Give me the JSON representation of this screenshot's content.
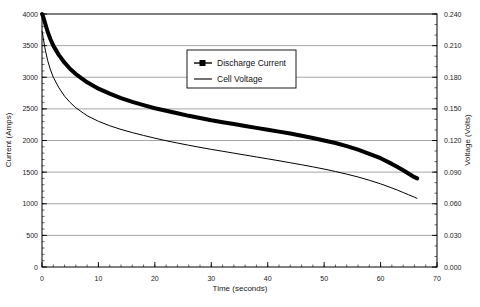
{
  "chart_data": {
    "type": "line",
    "title": "",
    "xlabel": "Time  (seconds)",
    "ylabel": "Current (Amps)",
    "y2label": "Voltage (Volts)",
    "xlim": [
      0,
      70
    ],
    "ylim": [
      0,
      4000
    ],
    "y2lim": [
      0.0,
      0.24
    ],
    "grid": true,
    "legend_position": "top-center",
    "xticks": [
      0,
      10,
      20,
      30,
      40,
      50,
      60,
      70
    ],
    "xtick_labels": [
      "0",
      "10",
      "20",
      "30",
      "40",
      "50",
      "60",
      "70"
    ],
    "x_minor_tick_step": 2,
    "yticks": [
      0,
      500,
      1000,
      1500,
      2000,
      2500,
      3000,
      3500,
      4000
    ],
    "ytick_labels": [
      "0",
      "500",
      "1000",
      "1500",
      "2000",
      "2500",
      "3000",
      "3500",
      "4000"
    ],
    "y_minor_tick_step": 100,
    "y2ticks": [
      0.0,
      0.03,
      0.06,
      0.09,
      0.12,
      0.15,
      0.18,
      0.21,
      0.24
    ],
    "y2tick_labels": [
      "0.000",
      "0.030",
      "0.060",
      "0.090",
      "0.120",
      "0.150",
      "0.180",
      "0.210",
      "0.240"
    ],
    "y2_minor_tick_step": 0.01,
    "series": [
      {
        "name": "Discharge Current",
        "axis": "left",
        "style": "thick-line-with-square-markers",
        "color": "#000000",
        "x": [
          0,
          0.2,
          0.5,
          1,
          1.5,
          2,
          3,
          4,
          5,
          6,
          8,
          10,
          12,
          14,
          16,
          18,
          20,
          22,
          24,
          26,
          28,
          30,
          32,
          34,
          36,
          38,
          40,
          42,
          44,
          46,
          48,
          50,
          52,
          54,
          56,
          58,
          60,
          62,
          63,
          64,
          65,
          66,
          66.5
        ],
        "values": [
          4000,
          3960,
          3870,
          3720,
          3600,
          3500,
          3350,
          3230,
          3130,
          3050,
          2920,
          2820,
          2740,
          2670,
          2610,
          2560,
          2510,
          2470,
          2430,
          2390,
          2355,
          2320,
          2290,
          2260,
          2230,
          2200,
          2170,
          2140,
          2110,
          2075,
          2040,
          2000,
          1960,
          1910,
          1855,
          1790,
          1720,
          1630,
          1580,
          1530,
          1475,
          1420,
          1400
        ]
      },
      {
        "name": "Cell Voltage",
        "axis": "right",
        "style": "thin-line",
        "color": "#000000",
        "x": [
          0,
          0.2,
          0.5,
          1,
          1.5,
          2,
          3,
          4,
          5,
          6,
          8,
          10,
          12,
          14,
          16,
          18,
          20,
          22,
          24,
          26,
          28,
          30,
          32,
          34,
          36,
          38,
          40,
          42,
          44,
          46,
          48,
          50,
          52,
          54,
          56,
          58,
          60,
          62,
          63,
          64,
          65,
          66,
          66.5
        ],
        "values": [
          0.224,
          0.218,
          0.208,
          0.196,
          0.187,
          0.18,
          0.17,
          0.162,
          0.156,
          0.151,
          0.1435,
          0.1382,
          0.134,
          0.1305,
          0.1275,
          0.1248,
          0.1222,
          0.1198,
          0.1176,
          0.1155,
          0.1135,
          0.1116,
          0.1098,
          0.108,
          0.1062,
          0.1044,
          0.1026,
          0.1008,
          0.0989,
          0.097,
          0.095,
          0.0929,
          0.0906,
          0.0881,
          0.0854,
          0.0823,
          0.0789,
          0.075,
          0.0729,
          0.0707,
          0.0684,
          0.0662,
          0.065
        ]
      }
    ],
    "legend": [
      {
        "label": "Discharge Current",
        "marker": "line-square-marker"
      },
      {
        "label": "Cell Voltage",
        "marker": "line"
      }
    ]
  },
  "figure": {
    "caption_partial": ""
  }
}
